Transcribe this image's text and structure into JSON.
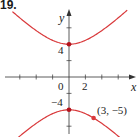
{
  "problem_number": "19.",
  "chart_data": {
    "type": "line",
    "title": "",
    "xlabel": "x",
    "ylabel": "y",
    "equation": "y^2/16 - x^2/16 = 1",
    "xlim": [
      -7,
      7
    ],
    "ylim": [
      -8,
      8
    ],
    "grid": false,
    "x_ticks": [
      -6,
      -4,
      -2,
      2,
      4,
      6
    ],
    "y_ticks": [
      -6,
      -4,
      -2,
      2,
      4,
      6
    ],
    "tick_labels": {
      "x": [
        {
          "value": 0,
          "label": "0"
        },
        {
          "value": 2,
          "label": "2"
        }
      ],
      "y": [
        {
          "value": 4,
          "label": "4"
        },
        {
          "value": -4,
          "label": "−4"
        }
      ]
    },
    "series": [
      {
        "name": "upper branch",
        "color": "#d9393b"
      },
      {
        "name": "lower branch",
        "color": "#d9393b"
      }
    ],
    "points": [
      {
        "x": 0,
        "y": 4,
        "label": ""
      },
      {
        "x": 0,
        "y": -4,
        "label": ""
      },
      {
        "x": 3,
        "y": -5,
        "label": "(3, −5)"
      }
    ]
  },
  "labels": {
    "x_axis": "x",
    "y_axis": "y",
    "origin": "0",
    "x_tick_2": "2",
    "y_tick_4": "4",
    "y_tick_neg4": "−4",
    "point_label": "(3, −5)"
  },
  "colors": {
    "curve": "#d9393b",
    "axis": "#333333"
  }
}
